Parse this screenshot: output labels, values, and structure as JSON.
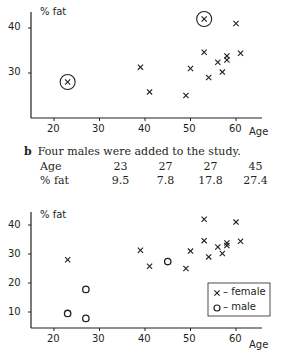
{
  "chart_data": [
    {
      "type": "scatter",
      "title": "",
      "xlabel": "Age",
      "ylabel": "% fat",
      "xlim": [
        15,
        65
      ],
      "ylim": [
        20,
        44
      ],
      "xticks": [
        20,
        30,
        40,
        50,
        60
      ],
      "yticks": [
        30,
        40
      ],
      "grid": false,
      "legend": null,
      "series": [
        {
          "name": "female",
          "marker": "x",
          "points": [
            [
              23,
              28
            ],
            [
              39,
              31.3
            ],
            [
              41,
              25.8
            ],
            [
              49,
              25
            ],
            [
              50,
              31
            ],
            [
              53,
              42
            ],
            [
              53,
              34.6
            ],
            [
              54,
              29
            ],
            [
              56,
              32.4
            ],
            [
              57,
              30.2
            ],
            [
              58,
              33.8
            ],
            [
              58,
              32.9
            ],
            [
              60,
              41
            ],
            [
              61,
              34.4
            ]
          ]
        }
      ],
      "annotations": [
        {
          "type": "circle",
          "point": [
            23,
            28
          ],
          "note": "outlier circled"
        },
        {
          "type": "circle",
          "point": [
            53,
            42
          ],
          "note": "outlier circled"
        }
      ]
    },
    {
      "type": "scatter",
      "title": "",
      "xlabel": "Age",
      "ylabel": "% fat",
      "xlim": [
        15,
        65
      ],
      "ylim": [
        5,
        44
      ],
      "xticks": [
        20,
        30,
        40,
        50,
        60
      ],
      "yticks": [
        10,
        20,
        30,
        40
      ],
      "grid": false,
      "legend": {
        "position": "lower right",
        "entries": [
          "× – female",
          "o – male"
        ]
      },
      "series": [
        {
          "name": "female",
          "marker": "x",
          "points": [
            [
              23,
              28
            ],
            [
              39,
              31.3
            ],
            [
              41,
              25.8
            ],
            [
              49,
              25
            ],
            [
              50,
              31
            ],
            [
              53,
              42
            ],
            [
              53,
              34.6
            ],
            [
              54,
              29
            ],
            [
              56,
              32.4
            ],
            [
              57,
              30.2
            ],
            [
              58,
              33.8
            ],
            [
              58,
              32.9
            ],
            [
              60,
              41
            ],
            [
              61,
              34.4
            ]
          ]
        },
        {
          "name": "male",
          "marker": "o",
          "points": [
            [
              23,
              9.5
            ],
            [
              27,
              7.8
            ],
            [
              27,
              17.8
            ],
            [
              45,
              27.4
            ]
          ]
        }
      ]
    }
  ],
  "chart1": {
    "ylabel": "% fat",
    "xlabel": "Age",
    "yticks": [
      "40",
      "30"
    ],
    "xticks": [
      "20",
      "30",
      "40",
      "50",
      "60"
    ]
  },
  "section_b": {
    "label": "b",
    "text": "Four males were added to the study.",
    "table": {
      "row_headers": [
        "Age",
        "% fat"
      ],
      "ages": [
        "23",
        "27",
        "27",
        "45"
      ],
      "fats": [
        "9.5",
        "7.8",
        "17.8",
        "27.4"
      ]
    }
  },
  "chart2": {
    "ylabel": "% fat",
    "xlabel": "Age",
    "yticks": [
      "40",
      "30",
      "20",
      "10"
    ],
    "xticks": [
      "20",
      "30",
      "40",
      "50",
      "60"
    ],
    "legend": {
      "female": "– female",
      "male": "– male"
    }
  },
  "colors": {
    "ink": "#231f20",
    "background": "#ffffff"
  }
}
